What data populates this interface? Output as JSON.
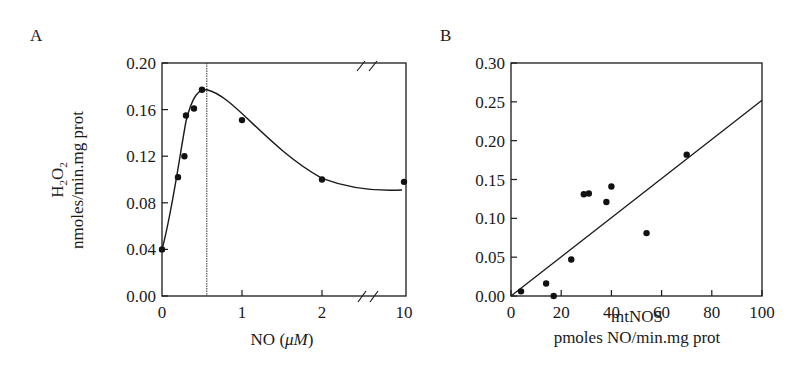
{
  "chart_data": [
    {
      "panel": "A",
      "type": "line",
      "title": "",
      "xlabel": "NO (μM)",
      "ylabel": "H2O2 nmoles/min.mg prot",
      "ylabel_line1": "H",
      "ylabel_line1_sub": "2",
      "ylabel_line1_mid": "O",
      "ylabel_line1_sub2": "2",
      "ylabel_line2": "nmoles/min.mg prot",
      "xlabel_main": "NO (",
      "xlabel_unit": "μM",
      "xlabel_close": ")",
      "x_ticks": [
        "0",
        "1",
        "2",
        "10"
      ],
      "y_ticks": [
        "0.00",
        "0.04",
        "0.08",
        "0.12",
        "0.16",
        "0.20"
      ],
      "ylim": [
        0,
        0.2
      ],
      "axis_break": "between 2 and 10 on x-axis",
      "vertical_reference_line_x": 0.56,
      "grid": false,
      "legend": null,
      "points": [
        {
          "x": 0.0,
          "y": 0.04
        },
        {
          "x": 0.2,
          "y": 0.102
        },
        {
          "x": 0.28,
          "y": 0.12
        },
        {
          "x": 0.3,
          "y": 0.155
        },
        {
          "x": 0.4,
          "y": 0.161
        },
        {
          "x": 0.5,
          "y": 0.177
        },
        {
          "x": 1.0,
          "y": 0.151
        },
        {
          "x": 2.0,
          "y": 0.1
        },
        {
          "x": 10.0,
          "y": 0.098
        }
      ],
      "fit_curve": "smooth rise to peak ~0.177 at NO≈0.56 then decay to ~0.091"
    },
    {
      "panel": "B",
      "type": "scatter",
      "title": "",
      "xlabel": "mtNOS",
      "xlabel_line2": "pmoles NO/min.mg prot",
      "ylabel": "",
      "x_ticks": [
        "0",
        "20",
        "40",
        "60",
        "80",
        "100"
      ],
      "y_ticks": [
        "0.00",
        "0.05",
        "0.10",
        "0.15",
        "0.20",
        "0.25",
        "0.30"
      ],
      "xlim": [
        0,
        100
      ],
      "ylim": [
        0,
        0.3
      ],
      "grid": false,
      "legend": null,
      "points": [
        {
          "x": 4,
          "y": 0.006
        },
        {
          "x": 14,
          "y": 0.016
        },
        {
          "x": 17,
          "y": 0.0
        },
        {
          "x": 24,
          "y": 0.047
        },
        {
          "x": 29,
          "y": 0.131
        },
        {
          "x": 31,
          "y": 0.132
        },
        {
          "x": 38,
          "y": 0.121
        },
        {
          "x": 40,
          "y": 0.141
        },
        {
          "x": 54,
          "y": 0.081
        },
        {
          "x": 70,
          "y": 0.182
        }
      ],
      "regression_line": {
        "x0": 0,
        "y0": 0.0,
        "x1": 100,
        "y1": 0.252
      }
    }
  ],
  "panels": {
    "a_label": "A",
    "b_label": "B"
  }
}
